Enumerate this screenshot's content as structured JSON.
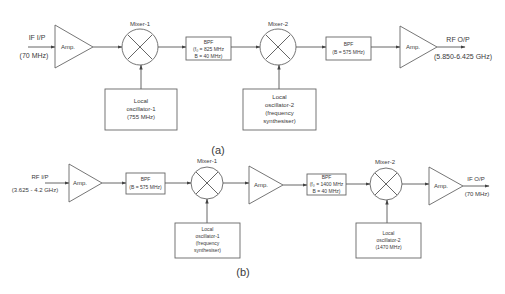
{
  "diagram_a": {
    "caption": "(a)",
    "input": {
      "label": "IF I/P",
      "freq": "(70 MHz)"
    },
    "amp1": {
      "label": "Amp."
    },
    "mixer1": {
      "label": "Mixer-1"
    },
    "lo1": {
      "line1": "Local",
      "line2": "oscillator-1",
      "line3": "(755 MHz)"
    },
    "bpf1": {
      "title": "BPF",
      "line1": "(f₀ = 825 MHz",
      "line2": "B = 40 MHz)"
    },
    "mixer2": {
      "label": "Mixer-2"
    },
    "lo2": {
      "line1": "Local",
      "line2": "oscillator-2",
      "line3": "(frequency",
      "line4": "synthesiser)"
    },
    "bpf2": {
      "title": "BPF",
      "line1": "(B = 575 MHz)"
    },
    "amp2": {
      "label": "Amp."
    },
    "output": {
      "label": "RF O/P",
      "freq": "(5.850-6.425 GHz)"
    }
  },
  "diagram_b": {
    "caption": "(b)",
    "input": {
      "label": "RF I/P",
      "freq": "(3.625 - 4.2 GHz)"
    },
    "amp1": {
      "label": "Amp."
    },
    "bpf1": {
      "title": "BPF",
      "line1": "(B = 575 MHz)"
    },
    "mixer1": {
      "label": "Mixer-1"
    },
    "lo1": {
      "line1": "Local",
      "line2": "oscillator-1",
      "line3": "(frequency",
      "line4": "synthesiser)"
    },
    "amp2": {
      "label": "Amp."
    },
    "bpf2": {
      "title": "BPF",
      "line1": "(f₀ = 1400 MHz",
      "line2": "B = 40 MHz)"
    },
    "mixer2": {
      "label": "Mixer-2"
    },
    "lo2": {
      "line1": "Local",
      "line2": "oscillator-2",
      "line3": "(1470 MHz)"
    },
    "amp3": {
      "label": "Amp."
    },
    "output": {
      "label": "IF O/P",
      "freq": "(70 MHz)"
    }
  }
}
